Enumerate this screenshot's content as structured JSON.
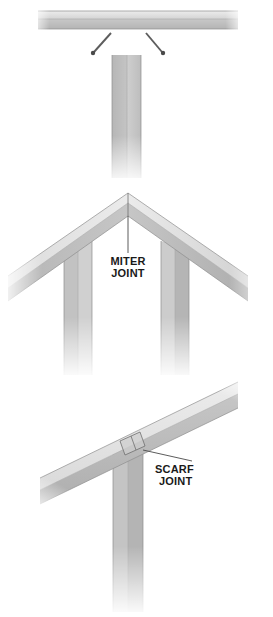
{
  "figure": {
    "background_color": "#ffffff",
    "width": 273,
    "height": 617
  },
  "palette": {
    "lumber_light": "#e2e2e2",
    "lumber_mid": "#c9c9c9",
    "lumber_dark": "#b0b0b0",
    "lumber_shadow": "#9b9b9b",
    "outline": "#8e8e8e",
    "label_text": "#1a1a1a",
    "leader": "#4a4a4a",
    "nail": "#5d5d5d"
  },
  "panels": [
    {
      "id": "butt-joint-panel",
      "name": "Butt joint with toe-nailing",
      "label": "",
      "parts": [
        {
          "name": "horizontal-plate",
          "orientation": "horizontal"
        },
        {
          "name": "vertical-post",
          "orientation": "vertical"
        },
        {
          "name": "nail-left",
          "orientation": "diagonal"
        },
        {
          "name": "nail-right",
          "orientation": "diagonal"
        }
      ],
      "nail_count": 2
    },
    {
      "id": "miter-joint-panel",
      "name": "Miter joint at peak",
      "label": {
        "line1": "MITER",
        "line2": "JOINT"
      },
      "parts": [
        {
          "name": "rafter-left",
          "orientation": "diagonal"
        },
        {
          "name": "rafter-right",
          "orientation": "diagonal"
        },
        {
          "name": "post-left",
          "orientation": "vertical"
        },
        {
          "name": "post-right",
          "orientation": "vertical"
        }
      ],
      "leader_from": {
        "x": 128,
        "y": 197
      },
      "leader_to": {
        "x": 128,
        "y": 253
      }
    },
    {
      "id": "scarf-joint-panel",
      "name": "Scarf joint on sloped beam",
      "label": {
        "line1": "SCARF",
        "line2": "JOINT"
      },
      "parts": [
        {
          "name": "sloped-beam",
          "orientation": "diagonal"
        },
        {
          "name": "vertical-post",
          "orientation": "vertical"
        },
        {
          "name": "scarf-cut",
          "orientation": "diagonal"
        }
      ],
      "leader_from": {
        "x": 143,
        "y": 450
      },
      "leader_to": {
        "x": 192,
        "y": 462
      }
    }
  ],
  "labels": {
    "miter_line1": "MITER",
    "miter_line2": "JOINT",
    "scarf_line1": "SCARF",
    "scarf_line2": "JOINT"
  }
}
